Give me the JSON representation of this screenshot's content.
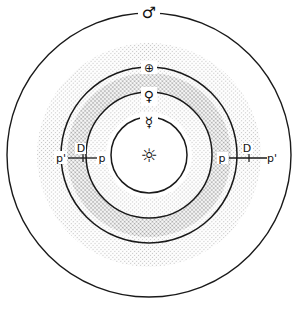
{
  "diagram": {
    "type": "heliocentric-orbit-diagram",
    "sun": {
      "name": "sun",
      "symbol": "☼"
    },
    "planets": [
      {
        "name": "mercury",
        "symbol": "☿"
      },
      {
        "name": "venus",
        "symbol": "♀"
      },
      {
        "name": "earth",
        "symbol": "⊕"
      },
      {
        "name": "mars",
        "symbol": "♂"
      }
    ],
    "lines": {
      "left": {
        "outer": "p'",
        "mid": "D",
        "inner": "p"
      },
      "right": {
        "inner": "p",
        "mid": "D",
        "outer": "p'"
      }
    },
    "colors": {
      "stroke": "#1a1a1a",
      "halftone_light_dot": "#c4c4c4",
      "halftone_dark_dot": "#9e9e9e",
      "background": "#ffffff"
    },
    "zones": {
      "light_band": "broad stippled annulus between Mercury and Mars orbits",
      "dark_band": "darker stippled annulus between Venus and Earth orbits"
    }
  }
}
